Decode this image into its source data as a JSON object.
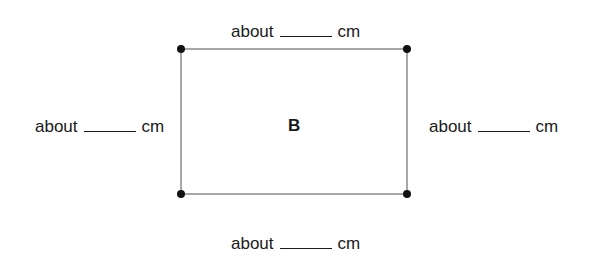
{
  "figure": {
    "shape_label": "B",
    "rectangle": {
      "corners": [
        [
          181,
          49
        ],
        [
          407,
          49
        ],
        [
          407,
          194
        ],
        [
          181,
          194
        ]
      ],
      "line_color": "#8a8a8a",
      "dot_color": "#111111"
    },
    "measurements": {
      "top": {
        "prefix": "about",
        "unit": "cm",
        "value": ""
      },
      "left": {
        "prefix": "about",
        "unit": "cm",
        "value": ""
      },
      "right": {
        "prefix": "about",
        "unit": "cm",
        "value": ""
      },
      "bottom": {
        "prefix": "about",
        "unit": "cm",
        "value": ""
      }
    }
  }
}
